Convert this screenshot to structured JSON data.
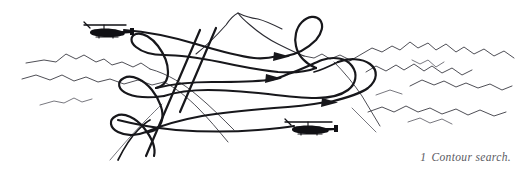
{
  "figure": {
    "title": "Contour search",
    "caption_number": "1",
    "caption_text": "Contour search.",
    "caption_full": "1  Contour search.",
    "type": "line-illustration",
    "background_color": "#ffffff",
    "ink_color": "#17171b",
    "terrain_color": "#3b3b43",
    "caption_color": "#5a5a62"
  },
  "scene": {
    "name": "contour-search-diagram",
    "description": "Helicopter contour search flight pattern over mountainous terrain",
    "elements": {
      "central_peak": "mountain-peak-outline",
      "background_ridges": "terrain-ridgeline",
      "flight_path": "serpentine-search-track",
      "turn_loops": "procedure-turn-loop",
      "direction_markers": "flight-direction-arrow"
    }
  },
  "aircraft": [
    {
      "id": "helicopter-upper-left",
      "label": "helicopter",
      "position": "upper-left",
      "heading": "right"
    },
    {
      "id": "helicopter-lower-right",
      "label": "helicopter",
      "position": "lower-right",
      "heading": "right"
    }
  ],
  "flight_direction_arrows": [
    {
      "id": "arrow-track-1",
      "track": 1,
      "direction": "right"
    },
    {
      "id": "arrow-track-2",
      "track": 2,
      "direction": "right"
    },
    {
      "id": "arrow-track-3",
      "track": 3,
      "direction": "right"
    }
  ],
  "turn_loops": [
    {
      "id": "loop-left-upper",
      "side": "left"
    },
    {
      "id": "loop-left-middle",
      "side": "left"
    },
    {
      "id": "loop-left-lower",
      "side": "left"
    },
    {
      "id": "loop-right-upper",
      "side": "right"
    }
  ]
}
